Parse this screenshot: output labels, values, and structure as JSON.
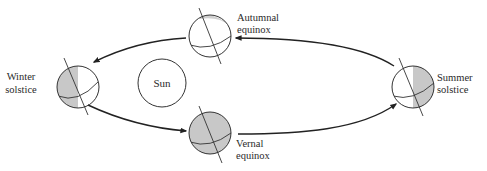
{
  "diagram": {
    "type": "earth-orbit-seasons",
    "sun": {
      "label": "Sun"
    },
    "positions": [
      {
        "id": "winter",
        "label_line1": "Winter",
        "label_line2": "solstice"
      },
      {
        "id": "autumnal",
        "label_line1": "Autumnal",
        "label_line2": "equinox"
      },
      {
        "id": "summer",
        "label_line1": "Summer",
        "label_line2": "solstice"
      },
      {
        "id": "vernal",
        "label_line1": "Vernal",
        "label_line2": "equinox"
      }
    ],
    "colors": {
      "stroke": "#333333",
      "shade": "#c8c8c8",
      "background": "#ffffff"
    }
  }
}
